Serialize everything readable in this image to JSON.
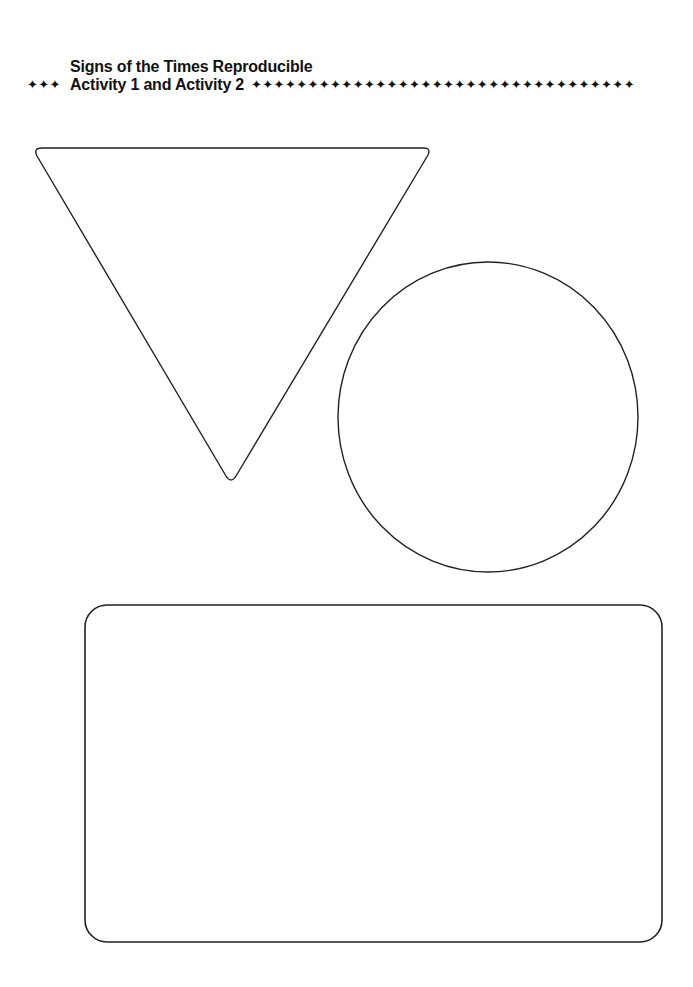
{
  "header": {
    "title": "Signs of the Times Reproducible",
    "subtitle": "Activity 1 and Activity 2",
    "leading_ornament": "✦✦✦",
    "trailing_ornament": "✦✦✦✦✦✦✦✦✦✦✦✦✦✦✦✦✦✦✦✦✦✦✦✦✦✦✦✦✦✦✦✦✦✦"
  },
  "shapes": {
    "triangle": {
      "label": "inverted triangle (yield sign outline)",
      "stroke": "#222222"
    },
    "circle": {
      "label": "circle sign outline",
      "stroke": "#222222"
    },
    "rectangle": {
      "label": "rounded rectangle sign outline",
      "stroke": "#222222"
    }
  }
}
